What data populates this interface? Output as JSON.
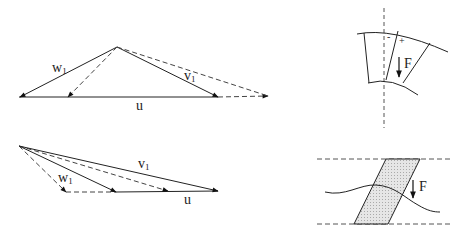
{
  "diagram": {
    "top_velocity_triangle": {
      "labels": {
        "w": "w",
        "w_sub": "1",
        "v": "v",
        "v_sub": "1",
        "u": "u"
      }
    },
    "bottom_velocity_triangle": {
      "labels": {
        "w": "w",
        "w_sub": "1",
        "v": "v",
        "v_sub": "1",
        "u": "u"
      }
    },
    "top_blade_sector": {
      "labels": {
        "minus": "-",
        "plus": "+",
        "force": "F"
      }
    },
    "bottom_blade_passage": {
      "labels": {
        "force": "F"
      }
    },
    "colors": {
      "stroke": "#222222",
      "dashed": "#444444",
      "hatch_fill": "#d8d8d8"
    }
  }
}
